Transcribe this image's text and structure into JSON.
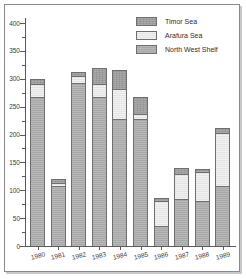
{
  "chart_data": {
    "type": "bar",
    "subtype": "stacked-vertical",
    "title": "",
    "subtitle": "",
    "xlabel": "",
    "ylabel": "",
    "categories": [
      "1980",
      "1981",
      "1982",
      "1983",
      "1984",
      "1985",
      "1986",
      "1987",
      "1988",
      "1989"
    ],
    "series": [
      {
        "name": "North West Shelf",
        "color": "#a8a8a8",
        "values": [
          267,
          108,
          293,
          268,
          228,
          228,
          36,
          84,
          80,
          107
        ]
      },
      {
        "name": "Arafura Sea",
        "color": "#e4e4e4",
        "values": [
          23,
          5,
          12,
          23,
          53,
          8,
          44,
          46,
          53,
          95
        ]
      },
      {
        "name": "Timor Sea",
        "color": "#9d9d9d",
        "values": [
          10,
          7,
          7,
          29,
          35,
          31,
          6,
          10,
          5,
          10
        ]
      }
    ],
    "stack_order_bottom_to_top": [
      "North West Shelf",
      "Arafura Sea",
      "Timor Sea"
    ],
    "totals": [
      300,
      120,
      312,
      320,
      316,
      267,
      86,
      140,
      138,
      212
    ],
    "ylim": [
      0,
      400
    ],
    "ytick_step": 50,
    "ytick_labels": [
      "0",
      "50",
      "100",
      "150",
      "200",
      "250",
      "300",
      "350",
      "400"
    ],
    "yticks": [
      0,
      50,
      100,
      150,
      200,
      250,
      300,
      350,
      400
    ],
    "grid": false,
    "legend_position": "top-right",
    "legend_entries": [
      {
        "label": "Timor Sea",
        "color": "#9d9d9d"
      },
      {
        "label": "Arafura Sea",
        "color": "#e4e4e4"
      },
      {
        "label": "North West Shelf",
        "color": "#a8a8a8"
      }
    ]
  },
  "legend": {
    "items": [
      {
        "label": "Timor Sea",
        "swatch_name": "legend-swatch-timor-sea"
      },
      {
        "label": "Arafura Sea",
        "swatch_name": "legend-swatch-arafura-sea"
      },
      {
        "label": "North West Shelf",
        "swatch_name": "legend-swatch-north-west-shelf"
      }
    ]
  },
  "colors": {
    "north_west_shelf": "#a8a8a8",
    "arafura_sea": "#e4e4e4",
    "timor_sea": "#9d9d9d",
    "axis": "#5a5a5a",
    "text": "#3a3a3a",
    "frame": "#8a8a8a",
    "frame_shadow": "#c9c9c9",
    "background": "#ffffff"
  }
}
